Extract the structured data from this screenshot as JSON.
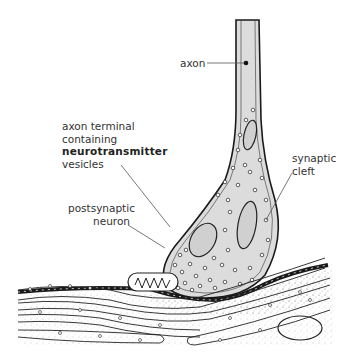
{
  "diagram": {
    "labels": {
      "axon": "axon",
      "axon_terminal_line1": "axon terminal",
      "axon_terminal_line2": "containing",
      "axon_terminal_line3": "neurotransmitter",
      "axon_terminal_line4": "vesicles",
      "synaptic_cleft_line1": "synaptic",
      "synaptic_cleft_line2": "cleft",
      "postsynaptic_line1": "postsynaptic",
      "postsynaptic_line2": "neuron"
    },
    "colors": {
      "axon_fill": "#dcdcdc",
      "outline": "#1a1a1a",
      "leader_line": "#555555",
      "stipple": "#9a9a9a",
      "background": "#ffffff"
    }
  }
}
